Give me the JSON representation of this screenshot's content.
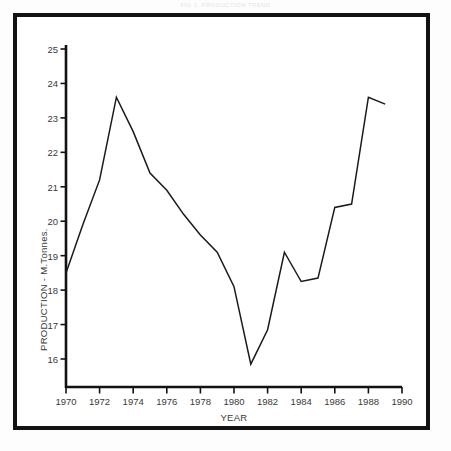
{
  "caption": {
    "text": "FIG 1. PRODUCTION TREND"
  },
  "chart_data": {
    "type": "line",
    "title": "",
    "xlabel": "YEAR",
    "ylabel": "PRODUCTION - M.Tonnes.",
    "xlim": [
      1970,
      1990
    ],
    "ylim": [
      16,
      25
    ],
    "grid": false,
    "legend": false,
    "line_color": "#1a1a1a",
    "x": [
      1970,
      1971,
      1972,
      1973,
      1974,
      1975,
      1976,
      1977,
      1978,
      1979,
      1980,
      1981,
      1982,
      1983,
      1984,
      1985,
      1986,
      1987,
      1988,
      1989
    ],
    "values": [
      18.5,
      19.9,
      21.2,
      23.6,
      22.6,
      21.4,
      20.9,
      20.2,
      19.6,
      19.1,
      18.1,
      15.85,
      16.85,
      19.1,
      18.25,
      18.35,
      20.4,
      20.5,
      23.6,
      23.4
    ],
    "xticks": [
      1970,
      1972,
      1974,
      1976,
      1978,
      1980,
      1982,
      1984,
      1986,
      1988,
      1990
    ],
    "xtick_labels": [
      "1970",
      "1972",
      "1974",
      "1976",
      "1978",
      "1980",
      "1982",
      "1984",
      "1986",
      "1988",
      "1990"
    ],
    "yticks": [
      16,
      17,
      18,
      19,
      20,
      21,
      22,
      23,
      24,
      25
    ],
    "ytick_labels": [
      "16",
      "17",
      "18",
      "19",
      "20",
      "21",
      "22",
      "23",
      "24",
      "25"
    ]
  }
}
